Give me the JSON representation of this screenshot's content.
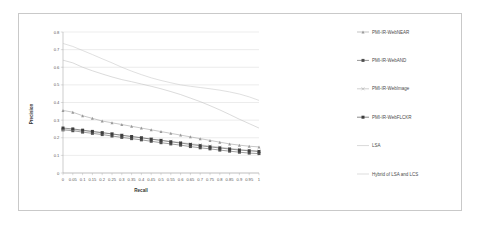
{
  "chart_data": {
    "type": "line",
    "title": "",
    "xlabel": "Recall",
    "ylabel": "Precision",
    "xlim": [
      0,
      1
    ],
    "ylim": [
      0,
      0.8
    ],
    "grid": true,
    "legend_position": "right",
    "x": [
      0,
      0.05,
      0.1,
      0.15,
      0.2,
      0.25,
      0.3,
      0.35,
      0.4,
      0.45,
      0.5,
      0.55,
      0.6,
      0.65,
      0.7,
      0.75,
      0.8,
      0.85,
      0.9,
      0.95,
      1
    ],
    "xtick_labels": [
      "0",
      "0.05",
      "0.1",
      "0.15",
      "0.2",
      "0.25",
      "0.3",
      "0.35",
      "0.4",
      "0.45",
      "0.5",
      "0.55",
      "0.6",
      "0.65",
      "0.7",
      "0.75",
      "0.8",
      "0.85",
      "0.9",
      "0.95",
      "1"
    ],
    "ytick_labels": [
      "0",
      "0.1",
      "0.2",
      "0.3",
      "0.4",
      "0.5",
      "0.6",
      "0.7",
      "0.8"
    ],
    "yticks": [
      0,
      0.1,
      0.2,
      0.3,
      0.4,
      0.5,
      0.6,
      0.7,
      0.8
    ],
    "series": [
      {
        "name": "PMI-IR-WebNEAR",
        "marker": "triangle",
        "color": "#9a9a9a",
        "values": [
          0.355,
          0.345,
          0.325,
          0.31,
          0.295,
          0.285,
          0.275,
          0.265,
          0.255,
          0.245,
          0.235,
          0.225,
          0.215,
          0.205,
          0.195,
          0.185,
          0.175,
          0.165,
          0.158,
          0.152,
          0.148
        ]
      },
      {
        "name": "PMI-IR-WebAND",
        "marker": "square",
        "color": "#4f4f4f",
        "values": [
          0.245,
          0.24,
          0.232,
          0.225,
          0.218,
          0.21,
          0.202,
          0.195,
          0.188,
          0.18,
          0.172,
          0.165,
          0.158,
          0.15,
          0.143,
          0.137,
          0.13,
          0.124,
          0.118,
          0.113,
          0.11
        ]
      },
      {
        "name": "PMI-IR-WebImage",
        "marker": "cross",
        "color": "#b0b0b0",
        "values": [
          0.245,
          0.245,
          0.24,
          0.234,
          0.228,
          0.221,
          0.214,
          0.207,
          0.2,
          0.193,
          0.186,
          0.18,
          0.173,
          0.166,
          0.16,
          0.153,
          0.147,
          0.14,
          0.134,
          0.129,
          0.125
        ]
      },
      {
        "name": "PMI-IR-WebFLCKR",
        "marker": "square-filled",
        "color": "#3d3d3d",
        "values": [
          0.255,
          0.25,
          0.243,
          0.236,
          0.229,
          0.222,
          0.214,
          0.207,
          0.2,
          0.192,
          0.185,
          0.177,
          0.17,
          0.162,
          0.155,
          0.148,
          0.142,
          0.136,
          0.13,
          0.126,
          0.122
        ]
      },
      {
        "name": "LSA",
        "marker": "none",
        "color": "#bdbdbd",
        "values": [
          0.64,
          0.625,
          0.6,
          0.58,
          0.562,
          0.545,
          0.53,
          0.518,
          0.505,
          0.492,
          0.478,
          0.462,
          0.445,
          0.425,
          0.405,
          0.382,
          0.358,
          0.332,
          0.305,
          0.28,
          0.255
        ]
      },
      {
        "name": "Hybrid of LSA and LCS",
        "marker": "none",
        "color": "#c6c6c6",
        "values": [
          0.735,
          0.718,
          0.695,
          0.672,
          0.648,
          0.625,
          0.6,
          0.578,
          0.558,
          0.54,
          0.525,
          0.512,
          0.5,
          0.492,
          0.485,
          0.478,
          0.47,
          0.46,
          0.448,
          0.432,
          0.412
        ]
      }
    ]
  },
  "legend": {
    "items": [
      {
        "label": "PMI-IR-WebNEAR"
      },
      {
        "label": "PMI-IR-WebAND"
      },
      {
        "label": "PMI-IR-WebImage"
      },
      {
        "label": "PMI-IR-WebFLCKR"
      },
      {
        "label": "LSA"
      },
      {
        "label": "Hybrid of LSA and LCS"
      }
    ]
  }
}
